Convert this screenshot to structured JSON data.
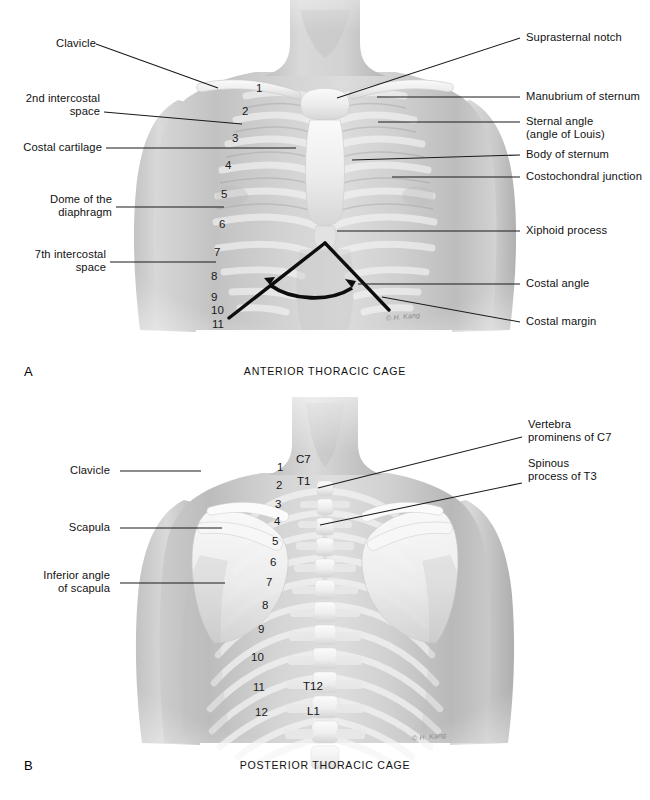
{
  "page": {
    "background_color": "#ffffff",
    "line_color": "#1a1a1a",
    "skin_color": "#c9c9c9",
    "bone_color": "#f2f2f2"
  },
  "panel_a": {
    "letter": "A",
    "caption": "ANTERIOR THORACIC CAGE",
    "signature": "© H. Kang",
    "labels_left": [
      {
        "id": "clavicle",
        "text": "Clavicle"
      },
      {
        "id": "second-intercostal-space",
        "text": "2nd intercostal\nspace"
      },
      {
        "id": "costal-cartilage",
        "text": "Costal cartilage"
      },
      {
        "id": "dome-of-diaphragm",
        "text": "Dome of the\ndiaphragm"
      },
      {
        "id": "seventh-intercostal-space",
        "text": "7th intercostal\nspace"
      }
    ],
    "labels_right": [
      {
        "id": "suprasternal-notch",
        "text": "Suprasternal notch"
      },
      {
        "id": "manubrium-of-sternum",
        "text": "Manubrium of sternum"
      },
      {
        "id": "sternal-angle",
        "text": "Sternal angle\n(angle of Louis)"
      },
      {
        "id": "body-of-sternum",
        "text": "Body of sternum"
      },
      {
        "id": "costochondral-junction",
        "text": "Costochondral junction"
      },
      {
        "id": "xiphoid-process",
        "text": "Xiphoid process"
      },
      {
        "id": "costal-angle",
        "text": "Costal angle"
      },
      {
        "id": "costal-margin",
        "text": "Costal margin"
      }
    ],
    "rib_numbers": [
      "1",
      "2",
      "3",
      "4",
      "5",
      "6",
      "7",
      "8",
      "9",
      "10",
      "11"
    ]
  },
  "panel_b": {
    "letter": "B",
    "caption": "POSTERIOR THORACIC CAGE",
    "signature": "© H. Kang",
    "labels_left": [
      {
        "id": "clavicle",
        "text": "Clavicle"
      },
      {
        "id": "scapula",
        "text": "Scapula"
      },
      {
        "id": "inferior-angle-of-scapula",
        "text": "Inferior angle\nof scapula"
      }
    ],
    "labels_right": [
      {
        "id": "vertebra-prominens-c7",
        "text": "Vertebra\nprominens of C7"
      },
      {
        "id": "spinous-process-t3",
        "text": "Spinous\nprocess of T3"
      }
    ],
    "rib_numbers": [
      "1",
      "2",
      "3",
      "4",
      "5",
      "6",
      "7",
      "8",
      "9",
      "10",
      "11",
      "12"
    ],
    "vertebra_labels": [
      "C7",
      "T1",
      "T12",
      "L1"
    ]
  }
}
